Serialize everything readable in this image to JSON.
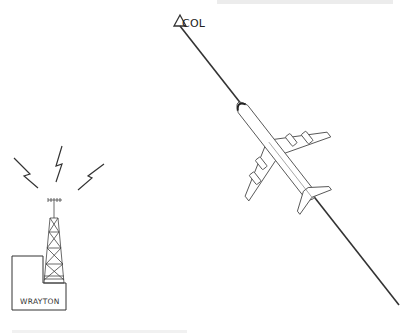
{
  "diagram": {
    "waypoint": {
      "name": "COL",
      "icon": "triangle-waypoint-icon"
    },
    "station": {
      "name": "WRAYTON",
      "icon": "radio-tower-icon"
    },
    "aircraft": {
      "type": "four-engine-airliner",
      "icon": "airplane-icon"
    },
    "course_line": {
      "from": "COL",
      "direction": "southeast"
    },
    "signals": {
      "count": 3,
      "icon": "lightning-bolt-icon"
    },
    "colors": {
      "line": "#333333",
      "outline": "#555555",
      "background": "#ffffff"
    }
  }
}
